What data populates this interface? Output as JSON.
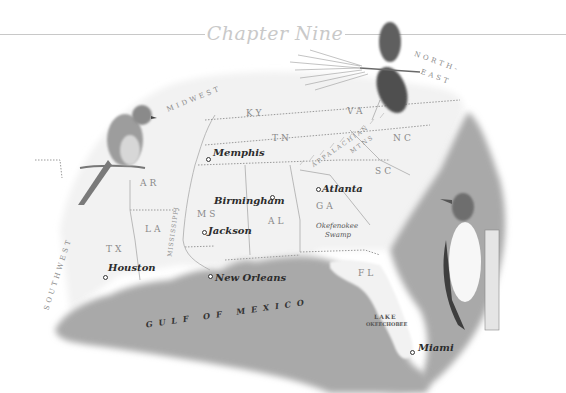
{
  "header": {
    "chapter_title": "Chapter Nine"
  },
  "map": {
    "regions": {
      "midwest": "MIDWEST",
      "northeast_line1": "NORTH-",
      "northeast_line2": "EAST",
      "southwest": "SOUTHWEST"
    },
    "states": {
      "ky": "KY",
      "va": "VA",
      "tn": "TN",
      "nc": "NC",
      "sc": "SC",
      "ar": "AR",
      "ms": "MS",
      "al": "AL",
      "ga": "GA",
      "la": "LA",
      "tx": "TX",
      "fl": "FL"
    },
    "cities": {
      "memphis": "Memphis",
      "birmingham": "Birmingham",
      "atlanta": "Atlanta",
      "jackson": "Jackson",
      "houston": "Houston",
      "new_orleans": "New Orleans",
      "miami": "Miami"
    },
    "features": {
      "appalachian_line1": "APPALACHIAN",
      "appalachian_line2": "MTNS",
      "mississippi": "MISSISSIPPI",
      "okefenokee_line1": "Okefenokee",
      "okefenokee_line2": "Swamp",
      "lake_line1": "LAKE",
      "lake_line2": "OKEECHOBEE",
      "gulf": "GULF OF MEXICO"
    },
    "colors": {
      "land": "#f2f2f2",
      "water": "#a9a9a9",
      "border": "#9a9a9a",
      "title": "#c9c9c9"
    }
  },
  "illustrations": {
    "bird_left": "bluebird perched on twig",
    "pine_cone": "pine cone with needles",
    "bird_right": "red-headed woodpecker on stump"
  }
}
